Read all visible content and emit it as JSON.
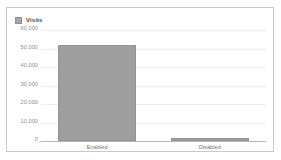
{
  "panel": {
    "background_color": "#ffffff",
    "border_color": "#c9c9c9"
  },
  "legend": {
    "position": "top-left",
    "swatch_icon": "legend-square-icon",
    "swatch_color": "#a6a6a6",
    "entries": [
      {
        "label": "Visits",
        "color": "#a6a6a6"
      }
    ]
  },
  "chart_data": {
    "type": "bar",
    "title": "",
    "subtitle": "",
    "xlabel": "",
    "ylabel": "",
    "categories": [
      "Enabled",
      "Disabled"
    ],
    "values": [
      52000,
      1500
    ],
    "series": [
      {
        "name": "Visits",
        "color": "#9e9e9e",
        "values": [
          52000,
          1500
        ]
      }
    ],
    "ylim": [
      0,
      60000
    ],
    "yticks": [
      0,
      10000,
      20000,
      30000,
      40000,
      50000,
      60000
    ],
    "ytick_labels": [
      "0",
      "10.000",
      "20.000",
      "30.000",
      "40.000",
      "50.000",
      "60.000"
    ],
    "xtick_labels": [
      "Enabled",
      "Disabled"
    ],
    "grid": true,
    "grid_axis": "y",
    "grid_color": "#ededed",
    "legend_position": "top-left",
    "bar_color": "#9e9e9e",
    "axis_color": "#b5b5b5",
    "tick_label_color": "#8a8a8a"
  }
}
